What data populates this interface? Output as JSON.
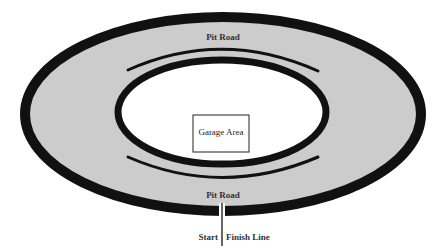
{
  "diagram": {
    "labels": {
      "pit_road_top": "Pit Road",
      "pit_road_bottom": "Pit Road",
      "garage_area": "Garage Area",
      "start": "Start",
      "finish_line": "Finish Line"
    },
    "colors": {
      "track_fill": "#cccccc",
      "stroke": "#111111",
      "infield_fill": "#ffffff",
      "background": "#ffffff",
      "text": "#333333"
    }
  }
}
